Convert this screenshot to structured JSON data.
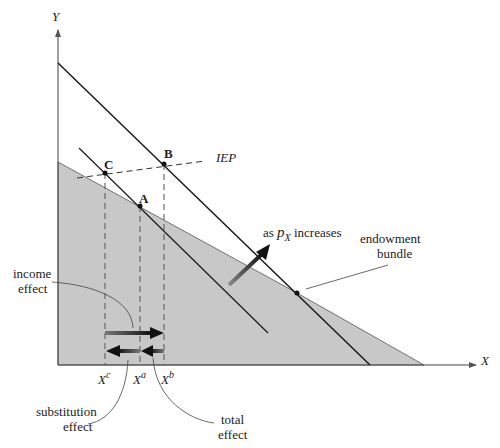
{
  "diagram": {
    "axes": {
      "x_label": "X",
      "y_label": "Y"
    },
    "points": {
      "A": "A",
      "B": "B",
      "C": "C"
    },
    "curve_labels": {
      "iep": "IEP",
      "price_change_prefix": "as ",
      "price_var": "p",
      "price_sub": "X",
      "price_change_suffix": " increases",
      "endowment_line1": "endowment",
      "endowment_line2": "bundle"
    },
    "tick_labels": {
      "xc_base": "X",
      "xc_sup": "c",
      "xa_base": "X",
      "xa_sup": "a",
      "xb_base": "X",
      "xb_sup": "b"
    },
    "effects": {
      "income_line1": "income",
      "income_line2": "effect",
      "substitution_line1": "substitution",
      "substitution_line2": "effect",
      "total_line1": "total",
      "total_line2": "effect"
    },
    "colors": {
      "shaded_region": "#c8c8c8",
      "line": "#1a1a1a",
      "dashed": "#444444"
    }
  }
}
